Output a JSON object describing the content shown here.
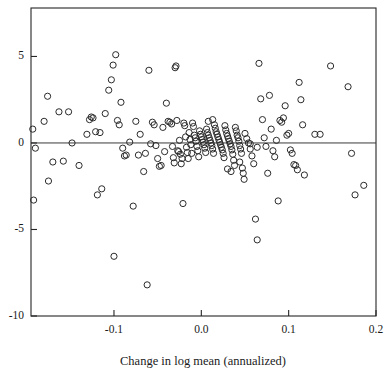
{
  "chart_data": {
    "type": "scatter",
    "title": "",
    "subtitle": "",
    "xlabel": "Change in log mean (annualized)",
    "ylabel": "",
    "xlim": [
      -0.195,
      0.2
    ],
    "ylim": [
      -10.0,
      7.8
    ],
    "xticks": [
      -0.1,
      0.0,
      0.1,
      0.2
    ],
    "xticklabels": [
      "-0.1",
      "0.0",
      "0.1",
      "0.2"
    ],
    "yticks": [
      5,
      0,
      -5,
      -10
    ],
    "yticklabels": [
      "5",
      "0",
      "-5",
      "-10"
    ],
    "grid": false,
    "legend": null,
    "annotations": [
      {
        "type": "hline",
        "y": 0.0,
        "label": "zero reference line"
      }
    ],
    "marker": {
      "shape": "open-circle",
      "size": 3.1,
      "edge_color": "#2b2b2b",
      "face_color": "none"
    },
    "n_points": 186,
    "series": [
      {
        "name": "observations",
        "points": [
          [
            -0.193,
            0.8
          ],
          [
            -0.192,
            -3.3
          ],
          [
            -0.19,
            -0.3
          ],
          [
            -0.18,
            1.25
          ],
          [
            -0.176,
            2.7
          ],
          [
            -0.175,
            -2.2
          ],
          [
            -0.17,
            -1.1
          ],
          [
            -0.163,
            1.8
          ],
          [
            -0.158,
            -1.05
          ],
          [
            -0.152,
            1.8
          ],
          [
            -0.14,
            -1.3
          ],
          [
            -0.131,
            0.5
          ],
          [
            -0.128,
            1.35
          ],
          [
            -0.126,
            1.5
          ],
          [
            -0.124,
            1.45
          ],
          [
            -0.121,
            0.65
          ],
          [
            -0.119,
            -3.0
          ],
          [
            -0.116,
            0.6
          ],
          [
            -0.114,
            -2.65
          ],
          [
            -0.11,
            1.7
          ],
          [
            -0.106,
            3.05
          ],
          [
            -0.103,
            3.65
          ],
          [
            -0.101,
            4.5
          ],
          [
            -0.1,
            -6.55
          ],
          [
            -0.098,
            5.1
          ],
          [
            -0.096,
            1.3
          ],
          [
            -0.094,
            1.05
          ],
          [
            -0.092,
            2.35
          ],
          [
            -0.09,
            -0.3
          ],
          [
            -0.088,
            -0.75
          ],
          [
            -0.086,
            -0.7
          ],
          [
            -0.082,
            0.05
          ],
          [
            -0.078,
            -3.65
          ],
          [
            -0.075,
            1.25
          ],
          [
            -0.072,
            -0.7
          ],
          [
            -0.07,
            0.5
          ],
          [
            -0.066,
            -1.65
          ],
          [
            -0.062,
            -8.2
          ],
          [
            -0.06,
            4.2
          ],
          [
            -0.058,
            -0.05
          ],
          [
            -0.056,
            1.2
          ],
          [
            -0.054,
            1.05
          ],
          [
            -0.052,
            -0.15
          ],
          [
            -0.05,
            -0.9
          ],
          [
            -0.048,
            -1.35
          ],
          [
            -0.046,
            -1.3
          ],
          [
            -0.044,
            0.9
          ],
          [
            -0.042,
            -0.5
          ],
          [
            -0.04,
            2.3
          ],
          [
            -0.038,
            1.25
          ],
          [
            -0.036,
            1.2
          ],
          [
            -0.034,
            1.1
          ],
          [
            -0.033,
            -0.2
          ],
          [
            -0.032,
            -0.85
          ],
          [
            -0.031,
            -1.15
          ],
          [
            -0.03,
            4.35
          ],
          [
            -0.029,
            4.45
          ],
          [
            -0.028,
            1.3
          ],
          [
            -0.027,
            -0.45
          ],
          [
            -0.026,
            -0.5
          ],
          [
            -0.025,
            0.15
          ],
          [
            -0.024,
            -0.65
          ],
          [
            -0.023,
            -1.2
          ],
          [
            -0.022,
            -0.9
          ],
          [
            -0.021,
            -3.5
          ],
          [
            -0.02,
            1.15
          ],
          [
            -0.019,
            1.0
          ],
          [
            -0.018,
            0.35
          ],
          [
            -0.017,
            -0.25
          ],
          [
            -0.016,
            -0.55
          ],
          [
            -0.015,
            -0.9
          ],
          [
            -0.014,
            0.6
          ],
          [
            -0.013,
            0.2
          ],
          [
            -0.012,
            -0.1
          ],
          [
            -0.011,
            -0.6
          ],
          [
            -0.01,
            1.15
          ],
          [
            -0.009,
            0.95
          ],
          [
            -0.008,
            0.45
          ],
          [
            -0.007,
            0.3
          ],
          [
            -0.006,
            0.1
          ],
          [
            -0.005,
            -0.2
          ],
          [
            -0.004,
            -0.45
          ],
          [
            -0.003,
            -0.8
          ],
          [
            -0.002,
            0.7
          ],
          [
            -0.001,
            0.5
          ],
          [
            0.0,
            0.35
          ],
          [
            0.001,
            0.2
          ],
          [
            0.002,
            0.05
          ],
          [
            0.003,
            -0.1
          ],
          [
            0.004,
            -0.3
          ],
          [
            0.005,
            -0.55
          ],
          [
            0.006,
            0.8
          ],
          [
            0.007,
            0.6
          ],
          [
            0.008,
            0.45
          ],
          [
            0.009,
            0.3
          ],
          [
            0.01,
            0.15
          ],
          [
            0.011,
            0.0
          ],
          [
            0.012,
            -0.15
          ],
          [
            0.013,
            -0.35
          ],
          [
            0.014,
            -0.6
          ],
          [
            0.015,
            1.05
          ],
          [
            0.016,
            0.85
          ],
          [
            0.017,
            0.65
          ],
          [
            0.018,
            0.5
          ],
          [
            0.019,
            0.35
          ],
          [
            0.02,
            0.2
          ],
          [
            0.021,
            0.05
          ],
          [
            0.022,
            -0.1
          ],
          [
            0.023,
            -0.25
          ],
          [
            0.024,
            -0.4
          ],
          [
            0.025,
            -0.6
          ],
          [
            0.026,
            -0.85
          ],
          [
            0.027,
            1.0
          ],
          [
            0.028,
            0.75
          ],
          [
            0.029,
            0.55
          ],
          [
            0.03,
            0.4
          ],
          [
            0.031,
            0.25
          ],
          [
            0.032,
            0.1
          ],
          [
            0.033,
            -0.05
          ],
          [
            0.034,
            -0.2
          ],
          [
            0.035,
            -0.4
          ],
          [
            0.036,
            -0.65
          ],
          [
            0.037,
            -1.0
          ],
          [
            0.038,
            -1.3
          ],
          [
            0.039,
            0.9
          ],
          [
            0.04,
            0.7
          ],
          [
            0.041,
            0.45
          ],
          [
            0.042,
            0.3
          ],
          [
            0.043,
            0.1
          ],
          [
            0.044,
            -0.15
          ],
          [
            0.045,
            -0.35
          ],
          [
            0.046,
            -0.6
          ],
          [
            0.047,
            -1.45
          ],
          [
            0.048,
            -1.75
          ],
          [
            0.049,
            -2.1
          ],
          [
            0.05,
            0.55
          ],
          [
            0.052,
            0.25
          ],
          [
            0.054,
            0.0
          ],
          [
            0.056,
            -0.35
          ],
          [
            0.058,
            -0.75
          ],
          [
            0.06,
            -1.2
          ],
          [
            0.062,
            -4.4
          ],
          [
            0.064,
            -5.6
          ],
          [
            0.066,
            4.6
          ],
          [
            0.068,
            2.55
          ],
          [
            0.07,
            1.35
          ],
          [
            0.072,
            0.3
          ],
          [
            0.074,
            -0.2
          ],
          [
            0.076,
            -1.75
          ],
          [
            0.078,
            2.75
          ],
          [
            0.08,
            0.8
          ],
          [
            0.082,
            -0.45
          ],
          [
            0.084,
            -0.8
          ],
          [
            0.086,
            0.15
          ],
          [
            0.088,
            -3.35
          ],
          [
            0.09,
            1.3
          ],
          [
            0.092,
            1.2
          ],
          [
            0.094,
            1.45
          ],
          [
            0.096,
            2.15
          ],
          [
            0.098,
            0.45
          ],
          [
            0.1,
            0.55
          ],
          [
            0.102,
            -0.4
          ],
          [
            0.104,
            -0.6
          ],
          [
            0.106,
            -1.25
          ],
          [
            0.108,
            -1.3
          ],
          [
            0.11,
            -1.55
          ],
          [
            0.112,
            3.5
          ],
          [
            0.114,
            2.5
          ],
          [
            0.116,
            1.05
          ],
          [
            0.118,
            -1.85
          ],
          [
            0.13,
            0.5
          ],
          [
            0.136,
            0.5
          ],
          [
            0.148,
            4.45
          ],
          [
            0.168,
            3.25
          ],
          [
            0.172,
            -0.6
          ],
          [
            0.176,
            -3.0
          ],
          [
            0.186,
            -2.45
          ],
          [
            -0.148,
            0.0
          ],
          [
            0.064,
            -0.25
          ],
          [
            0.056,
            -0.05
          ],
          [
            -0.064,
            -0.6
          ],
          [
            0.03,
            -1.5
          ],
          [
            0.034,
            -1.65
          ],
          [
            0.044,
            -1.1
          ],
          [
            0.013,
            1.35
          ],
          [
            0.008,
            1.25
          ]
        ]
      }
    ]
  },
  "axes": {
    "x_title": "Change in log mean (annualized)"
  }
}
